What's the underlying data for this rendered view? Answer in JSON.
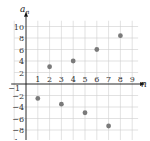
{
  "chart_data": {
    "type": "scatter",
    "title": "",
    "xlabel": "n",
    "ylabel": "a_n",
    "xlim": [
      -1,
      9.5
    ],
    "ylim": [
      -10,
      11
    ],
    "grid": true,
    "legend": null,
    "x_ticks": [
      -1,
      1,
      2,
      3,
      4,
      5,
      6,
      7,
      8,
      9
    ],
    "y_ticks": [
      10,
      8,
      6,
      4,
      2,
      -2,
      -4,
      -6,
      -8,
      -10
    ],
    "series": [
      {
        "name": "a_n",
        "x": [
          1,
          2,
          3,
          4,
          5,
          6,
          7,
          8
        ],
        "y": [
          -2.5,
          3,
          -3.5,
          4,
          -5,
          6,
          -7.3,
          8.4
        ]
      }
    ]
  },
  "colors": {
    "point": "#7a7a7a",
    "grid": "#cfcfcf",
    "axis": "#111111"
  },
  "labels": {
    "x_axis": "n",
    "y_axis_main": "a",
    "y_axis_sub": "n"
  }
}
